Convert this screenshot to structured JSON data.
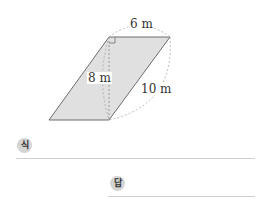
{
  "figure": {
    "shape": "parallelogram",
    "fill_color": "#e0e0e0",
    "stroke_color": "#6e6e6e",
    "top_label": "6 m",
    "height_label": "8 m",
    "side_label": "10 m"
  },
  "answer_area": {
    "expression_badge": "식",
    "answer_badge": "답"
  }
}
